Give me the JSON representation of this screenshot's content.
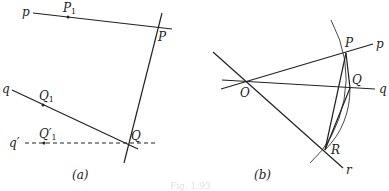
{
  "figure": {
    "caption": "Fig. 1.93",
    "panel_a": {
      "label": "(a)",
      "lines": {
        "p": "p",
        "q": "q",
        "q_prime": "q′"
      },
      "points": {
        "P1": "P",
        "P1_sub": "1",
        "P": "P",
        "Q1": "Q",
        "Q1_sub": "1",
        "Q1p": "Q′",
        "Q1p_sub": "1",
        "Q": "Q"
      }
    },
    "panel_b": {
      "label": "(b)",
      "lines": {
        "p": "p",
        "q": "q",
        "r": "r"
      },
      "points": {
        "O": "O",
        "P": "P",
        "Q": "Q",
        "R": "R"
      }
    }
  }
}
